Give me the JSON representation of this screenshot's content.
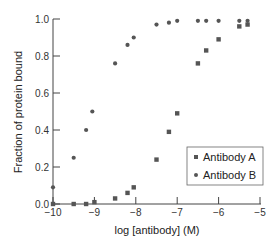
{
  "chart_data": {
    "type": "scatter",
    "title": "",
    "xlabel": "log [antibody] (M)",
    "ylabel": "Fraction of protein bound",
    "xlim": [
      -10,
      -5
    ],
    "ylim": [
      0,
      1.0
    ],
    "xticks": [
      -10,
      -9,
      -8,
      -7,
      -6,
      -5
    ],
    "yticks": [
      0.0,
      0.2,
      0.4,
      0.6,
      0.8,
      1.0
    ],
    "xtick_labels": [
      "−10",
      "−9",
      "−8",
      "−7",
      "−6",
      "−5"
    ],
    "ytick_labels": [
      "0.0",
      "0.2",
      "0.4",
      "0.6",
      "0.8",
      "1.0"
    ],
    "grid": false,
    "legend_position": "lower right",
    "series": [
      {
        "name": "Antibody A",
        "marker": "square",
        "color": "#555555",
        "x": [
          -10.0,
          -9.5,
          -9.2,
          -9.0,
          -8.5,
          -8.2,
          -8.05,
          -7.5,
          -7.2,
          -7.0,
          -6.5,
          -6.3,
          -6.0,
          -5.5,
          -5.3
        ],
        "y": [
          0.0,
          0.0,
          0.0,
          0.01,
          0.03,
          0.06,
          0.09,
          0.24,
          0.39,
          0.49,
          0.76,
          0.83,
          0.89,
          0.96,
          0.97
        ]
      },
      {
        "name": "Antibody B",
        "marker": "circle",
        "color": "#555555",
        "x": [
          -10.0,
          -9.5,
          -9.2,
          -9.05,
          -8.5,
          -8.2,
          -8.05,
          -7.5,
          -7.2,
          -7.0,
          -6.5,
          -6.3,
          -6.0,
          -5.5,
          -5.3
        ],
        "y": [
          0.09,
          0.25,
          0.4,
          0.5,
          0.76,
          0.86,
          0.9,
          0.97,
          0.98,
          0.99,
          0.99,
          0.99,
          0.99,
          0.99,
          0.99
        ]
      }
    ]
  }
}
